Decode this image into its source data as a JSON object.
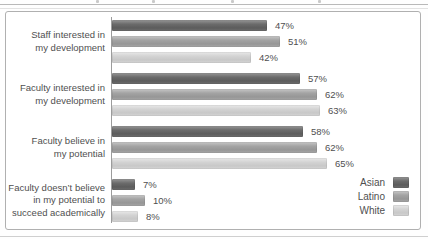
{
  "figure": {
    "colors": {
      "asian": "#6b6b6b",
      "latino": "#a3a3a3",
      "white": "#d3d3d3",
      "axis": "#9c9c9c",
      "text": "#4f4f4f",
      "border": "#b0b0b0"
    },
    "legend": [
      {
        "label": "Asian",
        "color_key": "asian"
      },
      {
        "label": "Latino",
        "color_key": "latino"
      },
      {
        "label": "White",
        "color_key": "white"
      }
    ]
  },
  "chart_data": {
    "type": "bar",
    "orientation": "horizontal",
    "unit": "%",
    "xlim": [
      0,
      100
    ],
    "grid": false,
    "legend_position": "bottom-right",
    "categories": [
      "Staff interested in my development",
      "Faculty interested in my development",
      "Faculty believe in my potential",
      "Faculty doesn’t believe in my potential to succeed academically"
    ],
    "category_label_lines": [
      [
        "Staff interested in",
        "my development"
      ],
      [
        "Faculty interested in",
        "my development"
      ],
      [
        "Faculty believe in",
        "my potential"
      ],
      [
        "Faculty doesn’t believe",
        "in my potential to",
        "succeed academically"
      ]
    ],
    "series": [
      {
        "name": "Asian",
        "color_key": "asian",
        "values": [
          47,
          57,
          58,
          7
        ]
      },
      {
        "name": "Latino",
        "color_key": "latino",
        "values": [
          51,
          62,
          62,
          10
        ]
      },
      {
        "name": "White",
        "color_key": "white",
        "values": [
          42,
          63,
          65,
          8
        ]
      }
    ],
    "value_labels": [
      [
        "47%",
        "51%",
        "42%"
      ],
      [
        "57%",
        "62%",
        "63%"
      ],
      [
        "58%",
        "62%",
        "65%"
      ],
      [
        "7%",
        "10%",
        "8%"
      ]
    ]
  }
}
